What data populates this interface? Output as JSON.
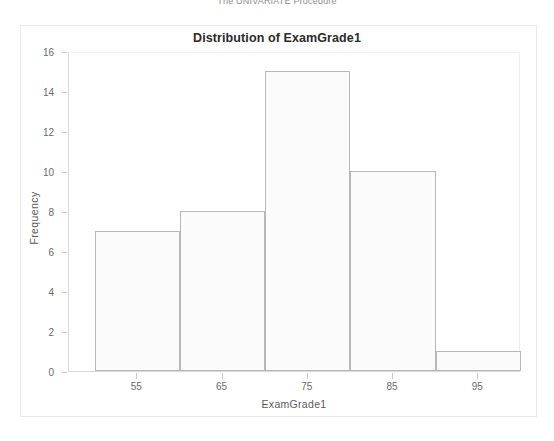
{
  "procedure_header": "The UNIVARIATE Procedure",
  "chart_data": {
    "type": "bar",
    "title": "Distribution of ExamGrade1",
    "xlabel": "ExamGrade1",
    "ylabel": "Frequency",
    "categories": [
      "55",
      "65",
      "75",
      "85",
      "95"
    ],
    "bin_edges": [
      50,
      60,
      70,
      80,
      90,
      100
    ],
    "values": [
      7,
      8,
      15,
      10,
      1
    ],
    "xlim": [
      47,
      100
    ],
    "ylim": [
      0,
      16
    ],
    "x_ticks": [
      55,
      65,
      75,
      85,
      95
    ],
    "y_ticks": [
      0,
      2,
      4,
      6,
      8,
      10,
      12,
      14,
      16
    ],
    "grid": false,
    "legend": null,
    "bar_fill_color": "#fbfbfb",
    "bar_border_color": "#b8b8b8",
    "axis_color": "#d8d8d8",
    "title_color": "#2b2b2b"
  }
}
